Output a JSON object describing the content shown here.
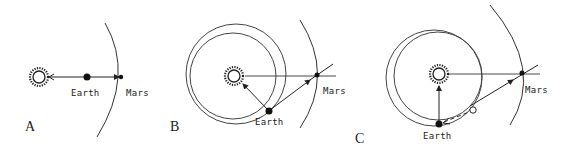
{
  "figure": {
    "panels": [
      {
        "id": "A",
        "letter": "A",
        "earth_label": "Earth",
        "mars_label": "Mars"
      },
      {
        "id": "B",
        "letter": "B",
        "earth_label": "Earth",
        "mars_label": "Mars"
      },
      {
        "id": "C",
        "letter": "C",
        "earth_label": "Earth",
        "mars_label": "Mars"
      }
    ],
    "colors": {
      "ink": "#222222",
      "background": "#ffffff"
    }
  }
}
